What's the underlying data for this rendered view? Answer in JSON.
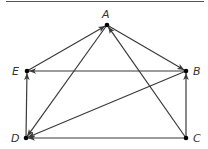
{
  "diagram": {
    "type": "directed-graph",
    "colors": {
      "edge": "#3a3a3a",
      "node": "#000000",
      "rule": "#555555"
    },
    "nodes": [
      {
        "id": "A",
        "label": "A",
        "x": 107,
        "y": 25,
        "lx": 102,
        "ly": 18
      },
      {
        "id": "B",
        "label": "B",
        "x": 186,
        "y": 71,
        "lx": 193,
        "ly": 75
      },
      {
        "id": "C",
        "label": "C",
        "x": 186,
        "y": 138,
        "lx": 193,
        "ly": 142
      },
      {
        "id": "D",
        "label": "D",
        "x": 26,
        "y": 138,
        "lx": 11,
        "ly": 142
      },
      {
        "id": "E",
        "label": "E",
        "x": 27,
        "y": 71,
        "lx": 12,
        "ly": 75
      }
    ],
    "edges": [
      {
        "from": "E",
        "to": "A"
      },
      {
        "from": "A",
        "to": "B"
      },
      {
        "from": "B",
        "to": "E"
      },
      {
        "from": "C",
        "to": "A"
      },
      {
        "from": "A",
        "to": "D"
      },
      {
        "from": "B",
        "to": "D"
      },
      {
        "from": "C",
        "to": "D"
      },
      {
        "from": "D",
        "to": "E"
      },
      {
        "from": "C",
        "to": "B"
      }
    ]
  }
}
